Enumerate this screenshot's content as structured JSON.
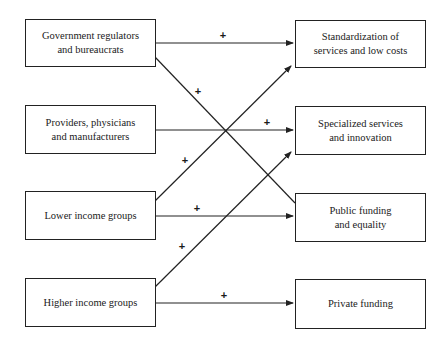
{
  "diagram": {
    "left_nodes": [
      {
        "id": "gov",
        "lines": [
          "Government regulators",
          "and bureaucrats"
        ]
      },
      {
        "id": "prov",
        "lines": [
          "Providers, physicians",
          "and manufacturers"
        ]
      },
      {
        "id": "low",
        "lines": [
          "Lower income groups"
        ]
      },
      {
        "id": "high",
        "lines": [
          "Higher income groups"
        ]
      }
    ],
    "right_nodes": [
      {
        "id": "std",
        "lines": [
          "Standardization of",
          "services and low costs"
        ]
      },
      {
        "id": "spec",
        "lines": [
          "Specialized services",
          "and innovation"
        ]
      },
      {
        "id": "pub",
        "lines": [
          "Public funding",
          "and equality"
        ]
      },
      {
        "id": "priv",
        "lines": [
          "Private funding"
        ]
      }
    ],
    "edges": [
      {
        "from": "gov",
        "to": "std",
        "sign": "+"
      },
      {
        "from": "gov",
        "to": "pub",
        "sign": "+"
      },
      {
        "from": "prov",
        "to": "spec",
        "sign": "+"
      },
      {
        "from": "low",
        "to": "std",
        "sign": "+"
      },
      {
        "from": "low",
        "to": "pub",
        "sign": "+"
      },
      {
        "from": "high",
        "to": "spec",
        "sign": "+"
      },
      {
        "from": "high",
        "to": "priv",
        "sign": "+"
      }
    ],
    "edge_sign": "+"
  }
}
